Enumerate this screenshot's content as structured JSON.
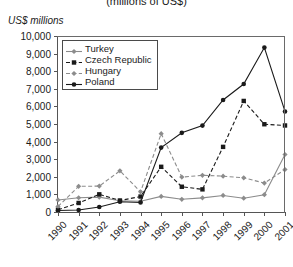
{
  "chart_data": {
    "type": "line",
    "title": "(millions of US$)",
    "ylabel": "US$ millions",
    "xlabel": "",
    "ylim": [
      0,
      10000
    ],
    "ytick_labels": [
      "10,000",
      "9,000",
      "8,000",
      "7,000",
      "6,000",
      "5,000",
      "4,000",
      "3,000",
      "2,000",
      "1,000",
      "0"
    ],
    "ytick_values": [
      10000,
      9000,
      8000,
      7000,
      6000,
      5000,
      4000,
      3000,
      2000,
      1000,
      0
    ],
    "grid": false,
    "legend_position": "top-left",
    "categories": [
      "1990",
      "1991",
      "1992",
      "1993",
      "1994",
      "1995",
      "1996",
      "1997",
      "1998",
      "1999",
      "2000",
      "2001"
    ],
    "x": [
      1990,
      1991,
      1992,
      1993,
      1994,
      1995,
      1996,
      1997,
      1998,
      1999,
      2000,
      2001
    ],
    "series": [
      {
        "name": "Turkey",
        "marker": "diamond",
        "color": "#8c8c8c",
        "dash": "solid",
        "values": [
          684,
          810,
          844,
          636,
          608,
          885,
          722,
          805,
          940,
          783,
          982,
          3266
        ]
      },
      {
        "name": "Czech Republic",
        "marker": "square",
        "color": "#1a1a1a",
        "dash": "dashed",
        "values": [
          132,
          513,
          1004,
          654,
          878,
          2568,
          1435,
          1286,
          3700,
          6310,
          4986,
          4916
        ]
      },
      {
        "name": "Hungary",
        "marker": "diamond",
        "color": "#8c8c8c",
        "dash": "dashed",
        "values": [
          311,
          1459,
          1471,
          2339,
          1147,
          4453,
          1983,
          2085,
          2036,
          1944,
          1643,
          2414
        ]
      },
      {
        "name": "Poland",
        "marker": "circle",
        "color": "#1a1a1a",
        "dash": "solid",
        "values": [
          88,
          117,
          284,
          580,
          542,
          3659,
          4498,
          4908,
          6365,
          7270,
          9341,
          5713
        ]
      }
    ]
  }
}
